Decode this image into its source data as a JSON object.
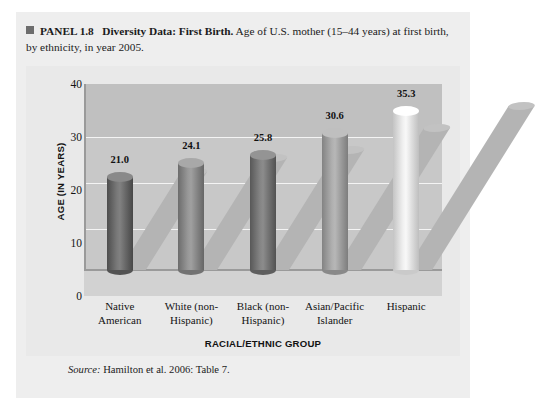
{
  "panel": {
    "marker_icon": "square-bullet-icon",
    "label": "PANEL 1.8",
    "title": "Diversity Data: First Birth.",
    "description": " Age of U.S. mother (15–44 years) at first birth, by ethnicity, in year 2005.",
    "source_prefix": "Source:",
    "source_text": " Hamilton et al. 2006: Table 7."
  },
  "chart_data": {
    "type": "bar",
    "title": "Diversity Data: First Birth",
    "subtitle": "Age of U.S. mother (15–44 years) at first birth, by ethnicity, in year 2005.",
    "categories": [
      "Native American",
      "White (non-Hispanic)",
      "Black (non-Hispanic)",
      "Asian/Pacific Islander",
      "Hispanic"
    ],
    "category_lines": [
      [
        "Native",
        "American"
      ],
      [
        "White (non-",
        "Hispanic)"
      ],
      [
        "Black (non-",
        "Hispanic)"
      ],
      [
        "Asian/Pacific",
        "Islander"
      ],
      [
        "Hispanic",
        ""
      ]
    ],
    "values": [
      21.0,
      24.1,
      25.8,
      30.6,
      35.3
    ],
    "value_labels": [
      "21.0",
      "24.1",
      "25.8",
      "30.6",
      "35.3"
    ],
    "xlabel": "RACIAL/ETHNIC GROUP",
    "ylabel": "AGE (IN YEARS)",
    "ylim": [
      0,
      40
    ],
    "yticks": [
      0,
      10,
      20,
      30,
      40
    ],
    "ytick_labels": [
      "0",
      "10",
      "20",
      "30",
      "40"
    ],
    "grid": true,
    "legend": false,
    "bar_colors": [
      "#6f6f6f",
      "#8e8e8e",
      "#7a7a7a",
      "#a5a5a5",
      "#e6e6e6"
    ],
    "source": "Hamilton et al. 2006: Table 7."
  },
  "colors": {
    "panel_background": "#eeeeee",
    "plot_background": "#c8c8c8",
    "gridline": "#f4f4f4",
    "text": "#141414"
  }
}
